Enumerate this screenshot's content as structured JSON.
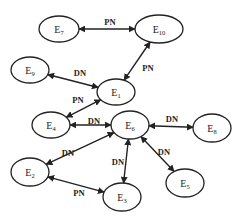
{
  "diagram": {
    "nodes": [
      {
        "id": "E7",
        "base": "E",
        "sub": "7",
        "x": 59,
        "y": 29,
        "rx": 20,
        "ry": 13
      },
      {
        "id": "E10",
        "base": "E",
        "sub": "10",
        "x": 159,
        "y": 29,
        "rx": 24,
        "ry": 14
      },
      {
        "id": "E9",
        "base": "E",
        "sub": "9",
        "x": 30,
        "y": 70,
        "rx": 19,
        "ry": 13
      },
      {
        "id": "E1",
        "base": "E",
        "sub": "1",
        "x": 116,
        "y": 92,
        "rx": 19,
        "ry": 13
      },
      {
        "id": "E4",
        "base": "E",
        "sub": "4",
        "x": 51,
        "y": 125,
        "rx": 19,
        "ry": 13
      },
      {
        "id": "E6",
        "base": "E",
        "sub": "6",
        "x": 130,
        "y": 125,
        "rx": 19,
        "ry": 14
      },
      {
        "id": "E8",
        "base": "E",
        "sub": "8",
        "x": 212,
        "y": 128,
        "rx": 19,
        "ry": 14
      },
      {
        "id": "E2",
        "base": "E",
        "sub": "2",
        "x": 30,
        "y": 172,
        "rx": 19,
        "ry": 14
      },
      {
        "id": "E3",
        "base": "E",
        "sub": "3",
        "x": 122,
        "y": 197,
        "rx": 19,
        "ry": 14
      },
      {
        "id": "E5",
        "base": "E",
        "sub": "5",
        "x": 185,
        "y": 183,
        "rx": 19,
        "ry": 14
      }
    ],
    "edges": [
      {
        "from": "E7",
        "to": "E10",
        "label": "PN",
        "lx": 110,
        "ly": 25
      },
      {
        "from": "E10",
        "to": "E1",
        "label": "PN",
        "lx": 148,
        "ly": 71
      },
      {
        "from": "E9",
        "to": "E1",
        "label": "DN",
        "lx": 80,
        "ly": 76
      },
      {
        "from": "E4",
        "to": "E1",
        "label": "PN",
        "lx": 78,
        "ly": 103
      },
      {
        "from": "E4",
        "to": "E6",
        "label": "DN",
        "lx": 94,
        "ly": 124
      },
      {
        "from": "E6",
        "to": "E8",
        "label": "DN",
        "lx": 172,
        "ly": 122
      },
      {
        "from": "E6",
        "to": "E2",
        "label": "DN",
        "lx": 68,
        "ly": 156
      },
      {
        "from": "E6",
        "to": "E3",
        "label": "DN",
        "lx": 118,
        "ly": 165
      },
      {
        "from": "E6",
        "to": "E5",
        "label": "DN",
        "lx": 164,
        "ly": 155
      },
      {
        "from": "E2",
        "to": "E3",
        "label": "PN",
        "lx": 79,
        "ly": 196
      }
    ]
  }
}
